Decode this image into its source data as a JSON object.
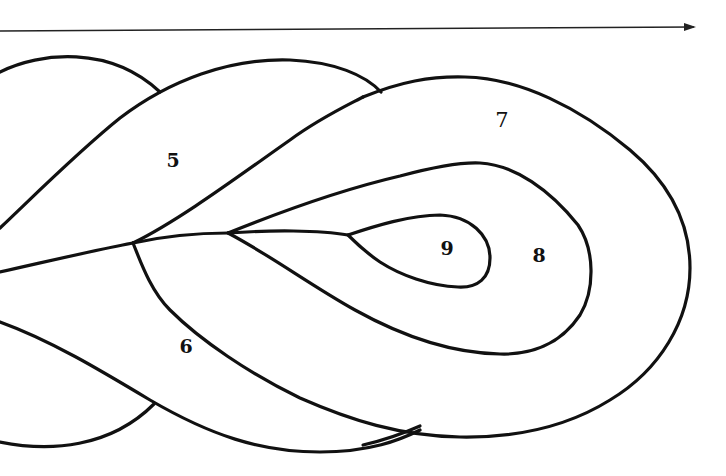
{
  "diagram": {
    "arrow": {
      "direction": "right",
      "x1": 0,
      "x2": 694,
      "y": 30
    },
    "regions": [
      {
        "id": "region-5",
        "label": "5",
        "x": 173,
        "y": 160
      },
      {
        "id": "region-6",
        "label": "6",
        "x": 186,
        "y": 346
      },
      {
        "id": "region-7",
        "label": "7",
        "x": 502,
        "y": 120
      },
      {
        "id": "region-8",
        "label": "8",
        "x": 539,
        "y": 255
      },
      {
        "id": "region-9",
        "label": "9",
        "x": 447,
        "y": 248
      }
    ],
    "junctions": [
      {
        "x": 133,
        "y": 243
      },
      {
        "x": 228,
        "y": 233
      },
      {
        "x": 348,
        "y": 235
      }
    ],
    "colors": {
      "line": "#111111",
      "background": "#ffffff"
    }
  }
}
